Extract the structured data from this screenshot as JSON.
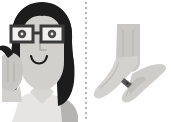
{
  "image": {
    "type": "illustration",
    "style": "flat-vector-grayscale",
    "background_color": "#ffffff",
    "width": 171,
    "height": 122,
    "layout": "two-panel-split-by-dotted-vertical-divider"
  },
  "divider": {
    "name": "dotted-vertical-divider",
    "orientation": "vertical",
    "style": "dotted",
    "color": "#b9b5b0",
    "x": 85
  },
  "panels": [
    {
      "id": "left",
      "name": "woman-with-glasses-panel",
      "subject": "smiling woman with long dark hair wearing glasses, hand raised to face",
      "elements": [
        {
          "name": "hair",
          "color": "#1c1c1c"
        },
        {
          "name": "face",
          "color": "#d2d0cc"
        },
        {
          "name": "glasses-frame",
          "color": "#3a3a3a"
        },
        {
          "name": "glasses-lens",
          "color": "#f2f1ef"
        },
        {
          "name": "eye-pupil",
          "color": "#4a4a4a"
        },
        {
          "name": "eyebrow",
          "color": "#3a3a3a"
        },
        {
          "name": "nose",
          "color": "#aeaca8"
        },
        {
          "name": "smile",
          "color": "#1c1c1c"
        },
        {
          "name": "hand",
          "color": "#c8c6c2"
        },
        {
          "name": "shirt",
          "color": "#e6e5e3"
        },
        {
          "name": "shoulder",
          "color": "#b6b4b0"
        }
      ]
    },
    {
      "id": "right",
      "name": "sign-language-hands-panel",
      "subject": "two hands forming a sign language gesture, forearm in sleeve above",
      "elements": [
        {
          "name": "sleeve-forearm",
          "color": "#c9c7c3"
        },
        {
          "name": "upper-hand",
          "color": "#d4d2ce"
        },
        {
          "name": "lower-hand",
          "color": "#cfcdc9"
        },
        {
          "name": "thumb",
          "color": "#c2c0bc"
        },
        {
          "name": "finger-contact-point",
          "color": "#5a5856"
        },
        {
          "name": "fold-line",
          "color": "#b8b6b2"
        }
      ]
    }
  ],
  "palette": {
    "black": "#1c1c1c",
    "dark_gray": "#3a3a3a",
    "mid_gray": "#aeaca8",
    "light_gray": "#d2d0cc",
    "pale_gray": "#e6e5e3",
    "white": "#ffffff"
  }
}
